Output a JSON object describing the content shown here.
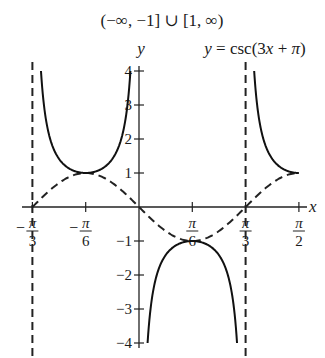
{
  "header": {
    "range_text": "(−∞, −1] ∪ [1, ∞)"
  },
  "chart_data": {
    "type": "line",
    "title": "y = csc(3x + π)",
    "xlabel": "x",
    "ylabel": "y",
    "xlim": [
      -1.0472,
      1.5708
    ],
    "ylim": [
      -4,
      4
    ],
    "grid": false,
    "legend": null,
    "x_ticks": [
      {
        "value": -1.0472,
        "num": "π",
        "den": "3",
        "sign": "−"
      },
      {
        "value": -0.5236,
        "num": "π",
        "den": "6",
        "sign": "−"
      },
      {
        "value": 0.5236,
        "num": "π",
        "den": "6",
        "sign": ""
      },
      {
        "value": 1.0472,
        "num": "π",
        "den": "3",
        "sign": ""
      },
      {
        "value": 1.5708,
        "num": "π",
        "den": "2",
        "sign": ""
      }
    ],
    "y_ticks": [
      {
        "value": 4,
        "label": "4"
      },
      {
        "value": 3,
        "label": "3"
      },
      {
        "value": 2,
        "label": "2"
      },
      {
        "value": 1,
        "label": "1"
      },
      {
        "value": -1,
        "label": "−1"
      },
      {
        "value": -2,
        "label": "−2"
      },
      {
        "value": -3,
        "label": "−3"
      },
      {
        "value": -4,
        "label": "−4"
      }
    ],
    "asymptotes": [
      -1.0472,
      1.0472
    ],
    "series": [
      {
        "name": "y = csc(3x + π)",
        "style": "solid",
        "x": [
          -0.9635,
          -0.7854,
          -0.5236,
          -0.2618,
          -0.0837,
          0.0837,
          0.2618,
          0.5236,
          0.7854,
          0.9635,
          1.1309,
          1.309,
          1.5708
        ],
        "y": [
          4.0,
          1.41,
          1.0,
          1.41,
          4.0,
          -4.0,
          -1.41,
          -1.0,
          -1.41,
          -4.0,
          4.0,
          1.41,
          1.0
        ]
      },
      {
        "name": "y = sin(3x + π)",
        "style": "dashed",
        "x": [
          -1.0472,
          -0.7854,
          -0.5236,
          -0.2618,
          0,
          0.2618,
          0.5236,
          0.7854,
          1.0472,
          1.309,
          1.5708
        ],
        "y": [
          0,
          0.71,
          1.0,
          0.71,
          0,
          -0.71,
          -1.0,
          -0.71,
          0,
          0.71,
          1.0
        ]
      }
    ]
  }
}
